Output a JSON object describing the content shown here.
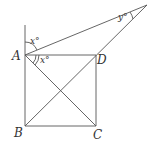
{
  "diagram": {
    "points": {
      "A": {
        "label": "A",
        "x": 25,
        "y": 55
      },
      "B": {
        "label": "B",
        "x": 25,
        "y": 126
      },
      "C": {
        "label": "C",
        "x": 96,
        "y": 126
      },
      "D": {
        "label": "D",
        "x": 96,
        "y": 55
      },
      "E": {
        "label": "",
        "x": 147,
        "y": 5
      }
    },
    "angles": {
      "x_upper": "x°",
      "x_lower": "x°",
      "y_apex": "y°"
    },
    "line_color": "#555555"
  }
}
